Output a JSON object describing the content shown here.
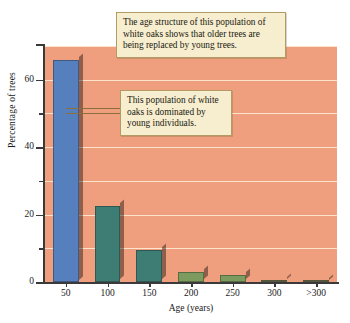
{
  "chart_data": {
    "type": "bar",
    "title": "",
    "xlabel": "Age (years)",
    "ylabel": "Percentage of trees",
    "categories": [
      "50",
      "100",
      "150",
      "200",
      "250",
      "300",
      ">300"
    ],
    "values": [
      66,
      22.5,
      9.5,
      3,
      2,
      0.6,
      0.2
    ],
    "ylim": [
      0,
      70
    ],
    "yticks_major": [
      0,
      20,
      40,
      60
    ],
    "yticks_minor": [
      10,
      30,
      50
    ],
    "ytick_labels": [
      "0",
      "20",
      "40",
      "60"
    ],
    "grid": true,
    "legend": "none",
    "annotations": [
      "The age structure of this population of white oaks shows that older trees are being replaced by young trees.",
      "This population of white oaks is dominated by young individuals."
    ],
    "colors": {
      "plot_background": "#ef9f7e",
      "gridline": "#fbe7d2",
      "bar_first": "#5580bd",
      "bar_mid": "#3d7d73",
      "bar_small": "#7d9b5e",
      "callout_background": "#f7edcf",
      "callout_border": "#b39b64",
      "axis": "#3a3a3a"
    },
    "bar_colors": [
      "#5580bd",
      "#3d7d73",
      "#3d7d73",
      "#7d9b5e",
      "#7d9b5e",
      "#7a7a55",
      "#7a7a55"
    ]
  },
  "annotations": {
    "top": "The age structure of this population of white oaks shows that older trees are being replaced by young trees.",
    "middle": "This population of white oaks is dominated by young individuals."
  }
}
